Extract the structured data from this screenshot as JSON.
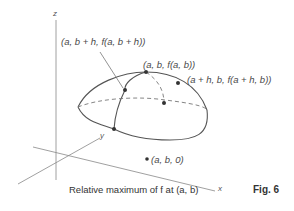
{
  "figure": {
    "caption": "Relative maximum of f at (a, b)",
    "figure_label": "Fig. 6"
  },
  "axes": {
    "z": "z",
    "y": "y",
    "x": "x"
  },
  "points": {
    "top": "(a, b, f(a, b))",
    "y_direction": "(a, b + h, f(a, b + h))",
    "x_direction": "(a + h, b, f(a + h, b))",
    "base": "(a, b, 0)"
  },
  "colors": {
    "line": "#555555",
    "dashed": "#777777",
    "point": "#333333"
  }
}
